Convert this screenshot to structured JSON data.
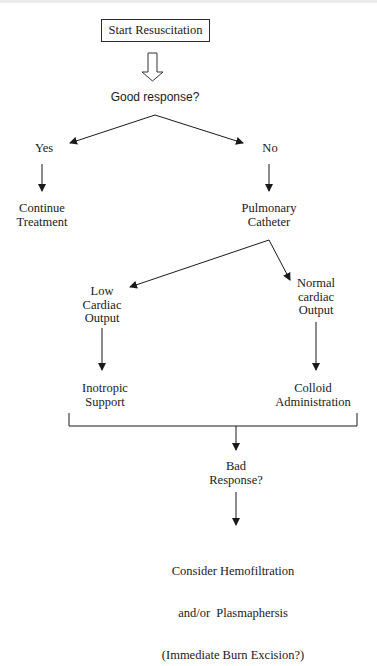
{
  "diagram": {
    "type": "flowchart",
    "colors": {
      "line": "#1a1a1a",
      "background": "#ffffff"
    },
    "nodes": {
      "start": {
        "label": "Start Resuscitation"
      },
      "good_response": {
        "label": "Good response?"
      },
      "yes": {
        "label": "Yes"
      },
      "no": {
        "label": "No"
      },
      "continue_treatment": {
        "line1": "Continue",
        "line2": "Treatment"
      },
      "pulmonary_catheter": {
        "line1": "Pulmonary",
        "line2": "Catheter"
      },
      "low_output": {
        "line1": "Low",
        "line2": "Cardiac",
        "line3": "Output"
      },
      "normal_output": {
        "line1": "Normal",
        "line2": "cardiac",
        "line3": "Output"
      },
      "inotropic": {
        "line1": "Inotropic",
        "line2": "Support"
      },
      "colloid": {
        "line1": "Colloid",
        "line2": "Administration"
      },
      "bad_response": {
        "line1": "Bad",
        "line2": "Response?"
      },
      "final": {
        "line1": "Consider Hemofiltration",
        "line2": "and/or  Plasmaphersis",
        "line3": "(Immediate Burn Excision?)"
      }
    },
    "edges": [
      {
        "from": "start",
        "to": "good_response",
        "style": "hollow-arrow"
      },
      {
        "from": "good_response",
        "to": "yes"
      },
      {
        "from": "good_response",
        "to": "no"
      },
      {
        "from": "yes",
        "to": "continue_treatment"
      },
      {
        "from": "no",
        "to": "pulmonary_catheter"
      },
      {
        "from": "pulmonary_catheter",
        "to": "low_output"
      },
      {
        "from": "pulmonary_catheter",
        "to": "normal_output"
      },
      {
        "from": "low_output",
        "to": "inotropic"
      },
      {
        "from": "normal_output",
        "to": "colloid"
      },
      {
        "from": [
          "inotropic",
          "colloid"
        ],
        "to": "bad_response",
        "style": "bracket"
      },
      {
        "from": "bad_response",
        "to": "final"
      }
    ]
  }
}
